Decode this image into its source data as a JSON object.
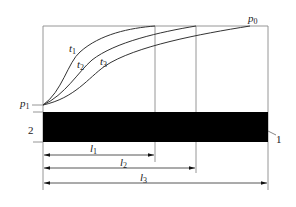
{
  "diagram": {
    "type": "pressure-curves-over-length",
    "curves": [
      {
        "label": "t",
        "sub": "1"
      },
      {
        "label": "t",
        "sub": "2"
      },
      {
        "label": "t",
        "sub": "3"
      }
    ],
    "points": {
      "p_start": {
        "label": "p",
        "sub": "1"
      },
      "p_end": {
        "label": "p",
        "sub": "0"
      }
    },
    "parts": [
      {
        "number": "1"
      },
      {
        "number": "2"
      }
    ],
    "lengths": [
      {
        "label": "l",
        "sub": "1"
      },
      {
        "label": "l",
        "sub": "2"
      },
      {
        "label": "l",
        "sub": "3"
      }
    ],
    "colors": {
      "line": "#333333",
      "bar": "#000000",
      "frame": "#8a8a8a"
    }
  }
}
